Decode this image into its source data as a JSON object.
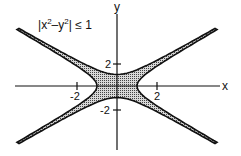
{
  "chart_data": {
    "type": "area",
    "title_parts": {
      "abs_open": "|",
      "x": "x",
      "exp1": "2",
      "minus": "–",
      "y": "y",
      "exp2": "2",
      "abs_close": "|",
      "rel": "≤",
      "rhs": "1"
    },
    "xlabel": "x",
    "ylabel": "y",
    "x_ticks": [
      {
        "value": -2,
        "label": "-2"
      },
      {
        "value": 2,
        "label": "2"
      }
    ],
    "y_ticks": [
      {
        "value": 2,
        "label": "2"
      },
      {
        "value": -2,
        "label": "-2"
      }
    ],
    "xlim": [
      -5,
      5
    ],
    "ylim": [
      -5,
      5
    ],
    "grid": false,
    "region": "shaded band between hyperbolas x^2 - y^2 = 1 and y^2 - x^2 = 1",
    "boundaries": [
      {
        "equation": "x^2 - y^2 = 1",
        "vertices": [
          [
            -1,
            0
          ],
          [
            1,
            0
          ]
        ]
      },
      {
        "equation": "y^2 - x^2 = 1",
        "vertices": [
          [
            0,
            -1
          ],
          [
            0,
            1
          ]
        ]
      }
    ],
    "asymptotes": [
      "y = x",
      "y = -x"
    ],
    "fill_color": "#9a9a9a",
    "line_color": "#111111"
  }
}
